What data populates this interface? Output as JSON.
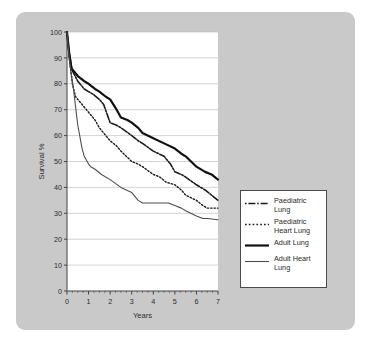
{
  "figure": {
    "panel_color": "#c9c9c9",
    "plot_background": "#ffffff",
    "axis_color": "#444444",
    "grid_color": "#b6b6b6"
  },
  "chart_data": {
    "type": "line",
    "title": "",
    "xlabel": "Years",
    "ylabel": "Survival %",
    "xlim": [
      0,
      7
    ],
    "ylim": [
      0,
      100
    ],
    "xticks": [
      0,
      1,
      2,
      3,
      4,
      5,
      6,
      7
    ],
    "xtick_labels": [
      "0",
      "1",
      "2",
      "3",
      "4",
      "5",
      "6",
      "7"
    ],
    "yticks": [
      0,
      10,
      20,
      30,
      40,
      50,
      60,
      70,
      80,
      90,
      100
    ],
    "ytick_labels": [
      "0",
      "10",
      "20",
      "30",
      "40",
      "50",
      "60",
      "70",
      "80",
      "90",
      "100"
    ],
    "grid": "horizontal",
    "legend_position": "outside-right-bottom",
    "series": [
      {
        "name": "Paediatric Lung",
        "legend_label": "Paediatric\nLung",
        "style": "dash-dot",
        "color": "#1c1c1c",
        "width": 1.6,
        "x": [
          0,
          0.1,
          0.25,
          0.5,
          0.8,
          1.0,
          1.2,
          1.5,
          1.7,
          2.0,
          2.3,
          2.5,
          3.0,
          3.3,
          3.5,
          4.0,
          4.5,
          4.8,
          5.0,
          5.3,
          5.5,
          6.0,
          6.4,
          6.7,
          7.0
        ],
        "y": [
          100,
          92,
          85,
          81,
          78,
          77,
          76,
          74,
          72,
          65,
          64,
          63,
          60,
          58,
          57,
          54,
          52,
          49,
          46,
          45,
          44,
          41,
          39,
          37,
          35
        ]
      },
      {
        "name": "Paediatric Heart Lung",
        "legend_label": "Paediatric\nHeart Lung",
        "style": "dotted",
        "color": "#1c1c1c",
        "width": 1.4,
        "x": [
          0,
          0.1,
          0.25,
          0.4,
          0.7,
          1.0,
          1.3,
          1.5,
          1.8,
          2.0,
          2.3,
          2.5,
          3.0,
          3.3,
          3.5,
          4.0,
          4.3,
          4.6,
          5.0,
          5.3,
          5.5,
          6.0,
          6.3,
          6.5,
          7.0
        ],
        "y": [
          100,
          90,
          80,
          75,
          72,
          69,
          66,
          63,
          60,
          58,
          56,
          54,
          50,
          49,
          48,
          45,
          44,
          42,
          41,
          39,
          37,
          35,
          33,
          32,
          32
        ]
      },
      {
        "name": "Adult Lung",
        "legend_label": "Adult Lung",
        "style": "solid-thick",
        "color": "#111111",
        "width": 2.2,
        "x": [
          0,
          0.1,
          0.2,
          0.5,
          0.8,
          1.0,
          1.3,
          1.5,
          1.8,
          2.0,
          2.3,
          2.5,
          2.8,
          3.0,
          3.3,
          3.5,
          4.0,
          4.5,
          5.0,
          5.3,
          5.5,
          6.0,
          6.4,
          6.7,
          7.0
        ],
        "y": [
          100,
          92,
          86,
          83,
          81,
          80,
          78,
          77,
          75,
          74,
          70,
          67,
          66,
          65,
          63,
          61,
          59,
          57,
          55,
          53,
          52,
          48,
          46,
          45,
          43
        ]
      },
      {
        "name": "Adult Heart Lung",
        "legend_label": "Adult Heart\nLung",
        "style": "solid-thin",
        "color": "#4d4d4d",
        "width": 1.1,
        "x": [
          0,
          0.1,
          0.3,
          0.5,
          0.7,
          0.8,
          1.0,
          1.1,
          1.3,
          1.6,
          2.0,
          2.5,
          3.0,
          3.3,
          3.5,
          4.0,
          4.5,
          4.7,
          5.0,
          5.3,
          5.5,
          6.0,
          6.3,
          6.5,
          7.0
        ],
        "y": [
          100,
          90,
          78,
          64,
          55,
          52,
          49,
          48,
          47,
          45,
          43,
          40,
          38,
          35,
          34,
          34,
          34,
          34,
          33,
          32,
          31,
          29,
          28,
          28,
          27.5
        ]
      }
    ]
  },
  "legend": {
    "items": [
      {
        "label": "Paediatric\nLung",
        "style": "dash-dot"
      },
      {
        "label": "Paediatric\nHeart Lung",
        "style": "dotted"
      },
      {
        "label": "Adult Lung",
        "style": "solid-thick"
      },
      {
        "label": "Adult Heart\nLung",
        "style": "solid-thin"
      }
    ]
  }
}
